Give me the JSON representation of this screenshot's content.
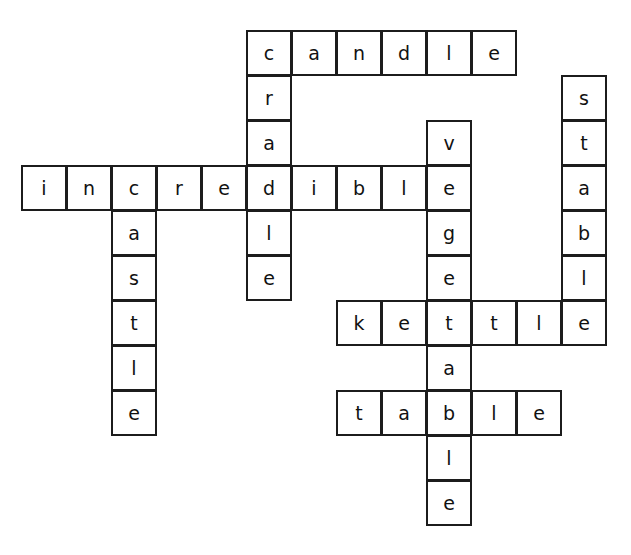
{
  "puzzle": {
    "kind": "crossword-answer-grid",
    "origin_x": 21,
    "origin_y": 30,
    "cell_size": 45,
    "columns": 14,
    "rows": 12,
    "colors": {
      "cell_border": "#1c1c1c",
      "cell_fill": "#ffffff",
      "letter": "#111111",
      "page_background": "#ffffff"
    },
    "entries": [
      {
        "id": "candle-across",
        "word": "candle",
        "direction": "across",
        "row": 0,
        "col": 5,
        "letters": [
          "c",
          "a",
          "n",
          "d",
          "l",
          "e"
        ]
      },
      {
        "id": "cradle-down",
        "word": "cradle",
        "direction": "down",
        "row": 0,
        "col": 5,
        "letters": [
          "c",
          "r",
          "a",
          "d",
          "l",
          "e"
        ]
      },
      {
        "id": "stable-down",
        "word": "stable",
        "direction": "down",
        "row": 1,
        "col": 12,
        "letters": [
          "s",
          "t",
          "a",
          "b",
          "l",
          "e"
        ]
      },
      {
        "id": "vegetable-down",
        "word": "vegetable",
        "direction": "down",
        "row": 2,
        "col": 9,
        "letters": [
          "v",
          "e",
          "g",
          "e",
          "t",
          "a",
          "b",
          "l",
          "e"
        ]
      },
      {
        "id": "incredible-across",
        "word": "incredible",
        "direction": "across",
        "row": 3,
        "col": 0,
        "letters": [
          "i",
          "n",
          "c",
          "r",
          "e",
          "d",
          "i",
          "b",
          "l",
          "e"
        ]
      },
      {
        "id": "castle-down",
        "word": "castle",
        "direction": "down",
        "row": 3,
        "col": 2,
        "letters": [
          "c",
          "a",
          "s",
          "t",
          "l",
          "e"
        ]
      },
      {
        "id": "kettle-across",
        "word": "kettle",
        "direction": "across",
        "row": 6,
        "col": 7,
        "letters": [
          "k",
          "e",
          "t",
          "t",
          "l",
          "e"
        ]
      },
      {
        "id": "table-across",
        "word": "table",
        "direction": "across",
        "row": 8,
        "col": 7,
        "letters": [
          "t",
          "a",
          "b",
          "l",
          "e"
        ]
      }
    ],
    "cells": [
      {
        "row": 0,
        "col": 5,
        "letter": "c"
      },
      {
        "row": 0,
        "col": 6,
        "letter": "a"
      },
      {
        "row": 0,
        "col": 7,
        "letter": "n"
      },
      {
        "row": 0,
        "col": 8,
        "letter": "d"
      },
      {
        "row": 0,
        "col": 9,
        "letter": "l"
      },
      {
        "row": 0,
        "col": 10,
        "letter": "e"
      },
      {
        "row": 1,
        "col": 5,
        "letter": "r"
      },
      {
        "row": 1,
        "col": 12,
        "letter": "s"
      },
      {
        "row": 2,
        "col": 5,
        "letter": "a"
      },
      {
        "row": 2,
        "col": 9,
        "letter": "v"
      },
      {
        "row": 2,
        "col": 12,
        "letter": "t"
      },
      {
        "row": 3,
        "col": 0,
        "letter": "i"
      },
      {
        "row": 3,
        "col": 1,
        "letter": "n"
      },
      {
        "row": 3,
        "col": 2,
        "letter": "c"
      },
      {
        "row": 3,
        "col": 3,
        "letter": "r"
      },
      {
        "row": 3,
        "col": 4,
        "letter": "e"
      },
      {
        "row": 3,
        "col": 5,
        "letter": "d"
      },
      {
        "row": 3,
        "col": 6,
        "letter": "i"
      },
      {
        "row": 3,
        "col": 7,
        "letter": "b"
      },
      {
        "row": 3,
        "col": 8,
        "letter": "l"
      },
      {
        "row": 3,
        "col": 9,
        "letter": "e"
      },
      {
        "row": 3,
        "col": 12,
        "letter": "a"
      },
      {
        "row": 4,
        "col": 2,
        "letter": "a"
      },
      {
        "row": 4,
        "col": 5,
        "letter": "l"
      },
      {
        "row": 4,
        "col": 9,
        "letter": "g"
      },
      {
        "row": 4,
        "col": 12,
        "letter": "b"
      },
      {
        "row": 5,
        "col": 2,
        "letter": "s"
      },
      {
        "row": 5,
        "col": 5,
        "letter": "e"
      },
      {
        "row": 5,
        "col": 9,
        "letter": "e"
      },
      {
        "row": 5,
        "col": 12,
        "letter": "l"
      },
      {
        "row": 6,
        "col": 2,
        "letter": "t"
      },
      {
        "row": 6,
        "col": 7,
        "letter": "k"
      },
      {
        "row": 6,
        "col": 8,
        "letter": "e"
      },
      {
        "row": 6,
        "col": 9,
        "letter": "t"
      },
      {
        "row": 6,
        "col": 10,
        "letter": "t"
      },
      {
        "row": 6,
        "col": 11,
        "letter": "l"
      },
      {
        "row": 6,
        "col": 12,
        "letter": "e"
      },
      {
        "row": 7,
        "col": 2,
        "letter": "l"
      },
      {
        "row": 7,
        "col": 9,
        "letter": "a"
      },
      {
        "row": 8,
        "col": 2,
        "letter": "e"
      },
      {
        "row": 8,
        "col": 7,
        "letter": "t"
      },
      {
        "row": 8,
        "col": 8,
        "letter": "a"
      },
      {
        "row": 8,
        "col": 9,
        "letter": "b"
      },
      {
        "row": 8,
        "col": 10,
        "letter": "l"
      },
      {
        "row": 8,
        "col": 11,
        "letter": "e"
      },
      {
        "row": 9,
        "col": 9,
        "letter": "l"
      },
      {
        "row": 10,
        "col": 9,
        "letter": "e"
      }
    ]
  }
}
